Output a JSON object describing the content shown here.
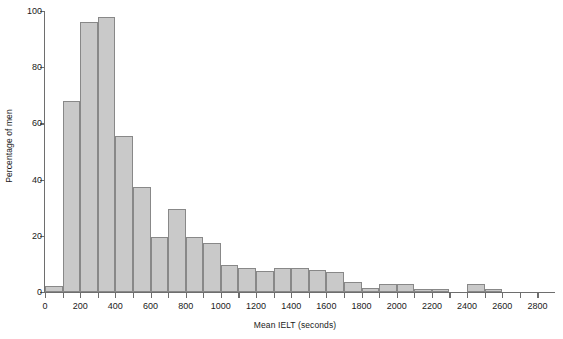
{
  "chart_data": {
    "type": "bar",
    "title": "",
    "subtitle": "",
    "xlabel": "Mean IELT (seconds)",
    "ylabel": "Percentage of men",
    "xlim": [
      0,
      2900
    ],
    "ylim": [
      0,
      100
    ],
    "grid": false,
    "legend": null,
    "bin_width": 100,
    "xticks": [
      0,
      100,
      200,
      300,
      400,
      500,
      600,
      700,
      800,
      900,
      1000,
      1100,
      1200,
      1300,
      1400,
      1500,
      1600,
      1700,
      1800,
      1900,
      2000,
      2100,
      2200,
      2300,
      2400,
      2500,
      2600,
      2700,
      2800
    ],
    "xticklabels": [
      "0",
      "",
      "200",
      "",
      "400",
      "",
      "600",
      "",
      "800",
      "",
      "1000",
      "",
      "1200",
      "",
      "1400",
      "",
      "1600",
      "",
      "1800",
      "",
      "2000",
      "",
      "2200",
      "",
      "2400",
      "",
      "2600",
      "",
      "2800"
    ],
    "yticks": [
      0,
      20,
      40,
      60,
      80,
      100
    ],
    "yticklabels": [
      "0",
      "20",
      "40",
      "60",
      "80",
      "100"
    ],
    "bin_starts": [
      0,
      100,
      200,
      300,
      400,
      500,
      600,
      700,
      800,
      900,
      1000,
      1100,
      1200,
      1300,
      1400,
      1500,
      1600,
      1700,
      1800,
      1900,
      2000,
      2100,
      2200,
      2300,
      2400,
      2500,
      2600,
      2700,
      2800
    ],
    "categories": [
      "0-100",
      "100-200",
      "200-300",
      "300-400",
      "400-500",
      "500-600",
      "600-700",
      "700-800",
      "800-900",
      "900-1000",
      "1000-1100",
      "1100-1200",
      "1200-1300",
      "1300-1400",
      "1400-1500",
      "1500-1600",
      "1600-1700",
      "1700-1800",
      "1800-1900",
      "1900-2000",
      "2000-2100",
      "2100-2200",
      "2200-2300",
      "2300-2400",
      "2400-2500",
      "2500-2600",
      "2600-2700",
      "2700-2800",
      "2800-2900"
    ],
    "values": [
      2,
      68,
      96,
      98,
      55.5,
      37.5,
      19.5,
      29.5,
      19.5,
      17.5,
      9.5,
      8.5,
      7.5,
      8.5,
      8.5,
      8,
      7,
      3.5,
      1.5,
      3,
      3,
      1,
      1,
      0,
      3,
      1,
      0,
      0,
      0
    ]
  }
}
